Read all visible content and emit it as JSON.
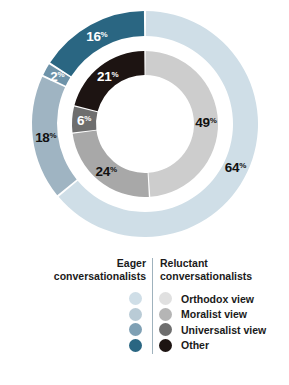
{
  "chart_data": {
    "type": "pie",
    "variant": "nested-donut",
    "title": "",
    "rings": [
      {
        "name": "Eager conversationalists",
        "position": "outer",
        "categories": [
          "Orthodox view",
          "Moralist view",
          "Universalist view",
          "Other"
        ],
        "values": [
          64,
          18,
          2,
          16
        ],
        "labels": [
          "64",
          "18",
          "2",
          "16"
        ],
        "colors": [
          "#cfdee7",
          "#9fb4c2",
          "#6e93a9",
          "#2a6682"
        ],
        "label_colors": [
          "#111111",
          "#111111",
          "#ffffff",
          "#ffffff"
        ]
      },
      {
        "name": "Reluctant conversationalists",
        "position": "inner",
        "categories": [
          "Orthodox view",
          "Moralist view",
          "Universalist view",
          "Other"
        ],
        "values": [
          49,
          24,
          6,
          21
        ],
        "labels": [
          "49",
          "24",
          "6",
          "21"
        ],
        "colors": [
          "#cdcdcd",
          "#a8a8a8",
          "#6e6e6e",
          "#1d1412"
        ],
        "label_colors": [
          "#111111",
          "#111111",
          "#ffffff",
          "#ffffff"
        ]
      }
    ],
    "percent_sign": "%",
    "legend_position": "bottom"
  },
  "legend": {
    "eager_heading": "Eager\nconversationalists",
    "eager_heading_line1": "Eager",
    "eager_heading_line2": "conversationalists",
    "reluctant_heading_line1": "Reluctant",
    "reluctant_heading_line2": "conversationalists",
    "items": [
      {
        "label": "Orthodox view",
        "eager_color": "#cfdee7",
        "reluctant_color": "#e0e0e0"
      },
      {
        "label": "Moralist view",
        "eager_color": "#b9cbd6",
        "reluctant_color": "#b5b5b5"
      },
      {
        "label": "Universalist view",
        "eager_color": "#7fa0b4",
        "reluctant_color": "#6e6e6e"
      },
      {
        "label": "Other",
        "eager_color": "#2a6682",
        "reluctant_color": "#1d1412"
      }
    ]
  },
  "colors": {
    "divider": "#9fb2bd",
    "background": "#ffffff",
    "text": "#1a1a1a"
  }
}
